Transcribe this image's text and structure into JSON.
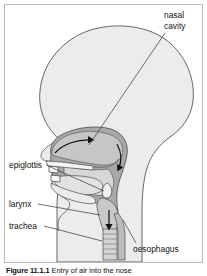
{
  "figure": {
    "caption_number": "Figure 11.1.1",
    "caption_text": "Entry of air into the nose",
    "title_alt": "Entry of air into the nose"
  },
  "labels": {
    "nasal_cavity_line1": "nasal",
    "nasal_cavity_line2": "cavity",
    "epiglottis": "epiglottis",
    "larynx": "larynx",
    "trachea": "trachea",
    "oesophagus": "oesophagus"
  },
  "colors": {
    "frame_border": "#b9b9b9",
    "head_fill": "#ececec",
    "head_outline": "#555555",
    "pharynx_fill": "#a8a8a8",
    "cavity_fill": "#c6c6c6",
    "tongue_fill": "#d8d8d8",
    "bone_fill": "#f4f4f4",
    "arrow": "#1a1a1a",
    "leader_line": "#4a4a4a",
    "text": "#111111",
    "background": "#ffffff"
  },
  "diagram": {
    "type": "anatomical-sagittal-section",
    "airflow_arrows": 3,
    "arrow_path_description": "air enters nose, passes back through nasal cavity, turns down through pharynx and larynx into trachea"
  }
}
